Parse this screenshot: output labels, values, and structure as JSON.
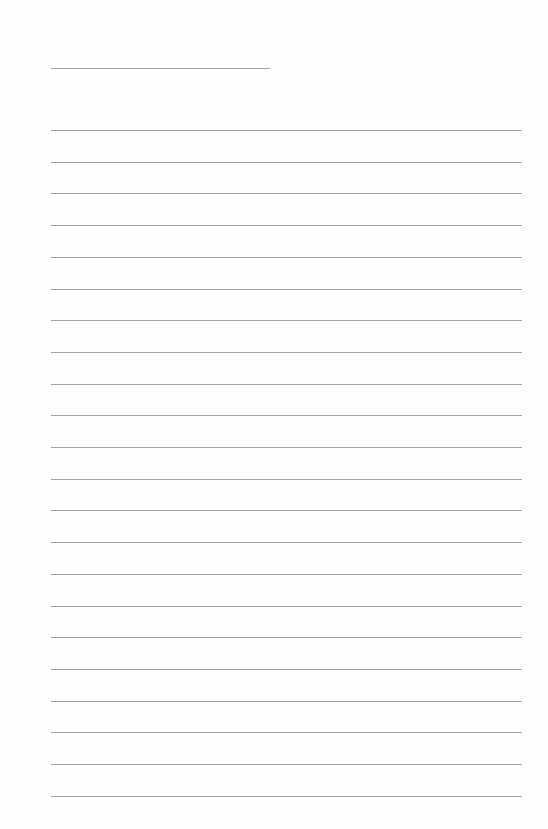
{
  "page": {
    "type": "lined-paper",
    "background_color": "#fefefe",
    "line_color": "#a3a3a3",
    "header_line": {
      "label": "",
      "top": 68,
      "left": 51,
      "width": 219
    },
    "writing_lines": {
      "count": 22,
      "first_top": 130,
      "spacing": 31.7,
      "left": 51,
      "width": 471
    }
  }
}
